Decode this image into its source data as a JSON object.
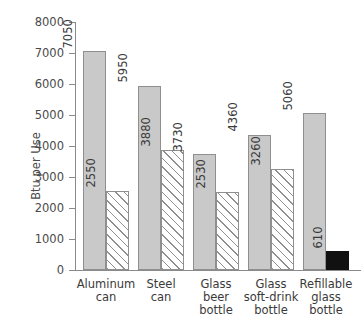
{
  "chart_data": {
    "type": "bar",
    "title": "",
    "xlabel": "",
    "ylabel": "Btu per Use",
    "ylim": [
      0,
      8000
    ],
    "ytick_values": [
      8000,
      7000,
      6000,
      5000,
      4000,
      3000,
      2000,
      1000,
      0
    ],
    "ytick_labels": [
      "8000",
      "7000",
      "6000",
      "5000",
      "4000",
      "3000",
      "2000",
      "1000",
      "0"
    ],
    "grid": false,
    "legend": "none",
    "categories": [
      "Aluminum can",
      "Steel can",
      "Glass beer bottle",
      "Glass soft-drink bottle",
      "Refillable glass bottle"
    ],
    "category_label_lines": [
      [
        "Aluminum",
        "can"
      ],
      [
        "Steel",
        "can"
      ],
      [
        "Glass",
        "beer",
        "bottle"
      ],
      [
        "Glass",
        "soft-drink",
        "bottle"
      ],
      [
        "Refillable",
        "glass",
        "bottle"
      ]
    ],
    "series": [
      {
        "name": "solid",
        "style": "solid-gray",
        "values": [
          7050,
          5950,
          3730,
          4360,
          5060
        ]
      },
      {
        "name": "second",
        "style": "hatched",
        "values": [
          2550,
          3880,
          2530,
          3260,
          610
        ],
        "styles_per_bar": [
          "hatched",
          "hatched",
          "hatched",
          "hatched",
          "solid-black"
        ]
      }
    ],
    "data_labels": [
      [
        "7050",
        "2550"
      ],
      [
        "5950",
        "3880"
      ],
      [
        "3730",
        "2530"
      ],
      [
        "4360",
        "3260"
      ],
      [
        "5060",
        "610"
      ]
    ],
    "colors": {
      "solid_fill": "#c9c9c9",
      "bar_border": "#8f8f8f",
      "hatch_line": "#8f8f8f",
      "black_fill": "#111111",
      "axis": "#8a8a8a",
      "text": "#3a3a3a",
      "background": "#ffffff"
    }
  }
}
